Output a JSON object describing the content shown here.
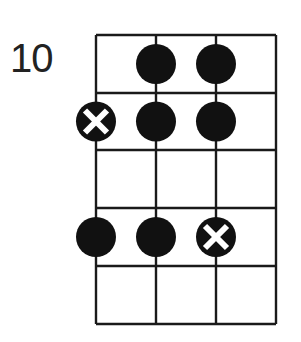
{
  "diagram": {
    "type": "fretboard-chord-diagram",
    "start_fret_label": "10",
    "strings": 4,
    "frets": 5,
    "grid": {
      "x": [
        96,
        156,
        216,
        276
      ],
      "y": [
        35,
        93,
        150,
        208,
        266,
        324
      ]
    },
    "colors": {
      "line": "#1a1a1a",
      "dot": "#111111",
      "background": "#ffffff",
      "mark": "#ffffff"
    },
    "dots": [
      {
        "string": 2,
        "fret": 1,
        "kind": "filled"
      },
      {
        "string": 3,
        "fret": 1,
        "kind": "filled"
      },
      {
        "string": 1,
        "fret": 2,
        "kind": "root-x"
      },
      {
        "string": 2,
        "fret": 2,
        "kind": "filled"
      },
      {
        "string": 3,
        "fret": 2,
        "kind": "filled"
      },
      {
        "string": 1,
        "fret": 4,
        "kind": "filled"
      },
      {
        "string": 2,
        "fret": 4,
        "kind": "filled"
      },
      {
        "string": 3,
        "fret": 4,
        "kind": "root-x"
      }
    ]
  }
}
